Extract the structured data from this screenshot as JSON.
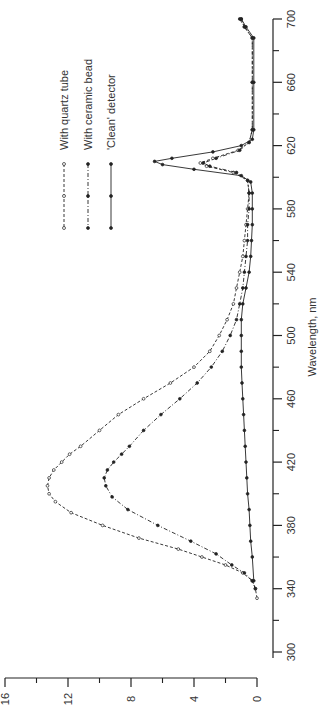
{
  "chart_data": {
    "type": "line",
    "orientation": "rotated-90-ccw",
    "title": "",
    "xlabel": "Wavelength, nm",
    "ylabel": "",
    "xlim": [
      300,
      700
    ],
    "ylim": [
      0,
      16
    ],
    "x_ticks": [
      300,
      340,
      380,
      420,
      460,
      500,
      540,
      580,
      620,
      660,
      700
    ],
    "x_tick_labels": [
      "300",
      "340",
      "380",
      "420",
      "460",
      "500",
      "540",
      "580",
      "620",
      "660",
      "700"
    ],
    "x_minor_ticks": [
      320,
      360,
      400,
      440,
      480,
      520,
      560,
      600,
      640,
      680
    ],
    "y_ticks": [
      0,
      4,
      8,
      12,
      16
    ],
    "y_tick_labels": [
      "0",
      "4",
      "8",
      "12",
      "16"
    ],
    "y_minor_ticks": [
      2,
      6,
      10,
      14
    ],
    "grid": false,
    "legend_position": "upper-left (rotated)",
    "series": [
      {
        "name": "With quartz tube",
        "style": "dashed",
        "marker": "open-circle",
        "points": [
          [
            334,
            0.0
          ],
          [
            340,
            0.1
          ],
          [
            345,
            0.3
          ],
          [
            350,
            0.9
          ],
          [
            355,
            2.0
          ],
          [
            360,
            3.5
          ],
          [
            365,
            5.0
          ],
          [
            372,
            7.5
          ],
          [
            380,
            9.8
          ],
          [
            388,
            11.8
          ],
          [
            395,
            12.8
          ],
          [
            400,
            13.2
          ],
          [
            405,
            13.3
          ],
          [
            410,
            13.2
          ],
          [
            415,
            12.9
          ],
          [
            420,
            12.4
          ],
          [
            425,
            11.9
          ],
          [
            430,
            11.2
          ],
          [
            440,
            10.0
          ],
          [
            450,
            8.8
          ],
          [
            460,
            7.2
          ],
          [
            470,
            5.5
          ],
          [
            480,
            4.0
          ],
          [
            490,
            3.0
          ],
          [
            500,
            2.4
          ],
          [
            510,
            1.9
          ],
          [
            520,
            1.5
          ],
          [
            530,
            1.3
          ],
          [
            540,
            1.1
          ],
          [
            550,
            0.9
          ],
          [
            560,
            0.8
          ],
          [
            570,
            0.7
          ],
          [
            580,
            0.6
          ],
          [
            590,
            0.5
          ],
          [
            598,
            0.6
          ],
          [
            603,
            1.5
          ],
          [
            607,
            3.2
          ],
          [
            609,
            3.6
          ],
          [
            612,
            2.8
          ],
          [
            617,
            1.2
          ],
          [
            622,
            0.5
          ],
          [
            630,
            0.3
          ],
          [
            660,
            0.3
          ],
          [
            688,
            0.3
          ],
          [
            695,
            0.8
          ],
          [
            700,
            1.0
          ]
        ]
      },
      {
        "name": "With ceramic bead",
        "style": "dash-dot",
        "marker": "filled-circle",
        "points": [
          [
            340,
            0.1
          ],
          [
            345,
            0.3
          ],
          [
            350,
            0.8
          ],
          [
            355,
            1.6
          ],
          [
            362,
            2.6
          ],
          [
            370,
            4.2
          ],
          [
            380,
            6.3
          ],
          [
            390,
            8.2
          ],
          [
            398,
            9.2
          ],
          [
            405,
            9.6
          ],
          [
            410,
            9.7
          ],
          [
            415,
            9.5
          ],
          [
            420,
            9.1
          ],
          [
            425,
            8.6
          ],
          [
            430,
            8.1
          ],
          [
            440,
            7.2
          ],
          [
            450,
            6.1
          ],
          [
            460,
            4.9
          ],
          [
            470,
            3.8
          ],
          [
            480,
            2.9
          ],
          [
            490,
            2.2
          ],
          [
            500,
            1.7
          ],
          [
            510,
            1.3
          ],
          [
            520,
            1.1
          ],
          [
            530,
            0.9
          ],
          [
            540,
            0.8
          ],
          [
            550,
            0.7
          ],
          [
            560,
            0.6
          ],
          [
            570,
            0.6
          ],
          [
            580,
            0.5
          ],
          [
            590,
            0.5
          ],
          [
            598,
            0.6
          ],
          [
            603,
            1.3
          ],
          [
            607,
            3.0
          ],
          [
            609,
            3.4
          ],
          [
            612,
            2.6
          ],
          [
            617,
            1.1
          ],
          [
            622,
            0.5
          ],
          [
            630,
            0.3
          ],
          [
            660,
            0.3
          ],
          [
            688,
            0.3
          ],
          [
            695,
            0.8
          ],
          [
            700,
            1.1
          ]
        ]
      },
      {
        "name": "'Clean' detector",
        "style": "solid",
        "marker": "filled-circle",
        "points": [
          [
            345,
            0.2
          ],
          [
            360,
            0.3
          ],
          [
            370,
            0.4
          ],
          [
            380,
            0.45
          ],
          [
            390,
            0.5
          ],
          [
            400,
            0.6
          ],
          [
            410,
            0.65
          ],
          [
            420,
            0.7
          ],
          [
            430,
            0.75
          ],
          [
            440,
            0.8
          ],
          [
            450,
            0.85
          ],
          [
            460,
            0.9
          ],
          [
            470,
            0.95
          ],
          [
            480,
            1.0
          ],
          [
            490,
            1.0
          ],
          [
            500,
            1.0
          ],
          [
            510,
            1.0
          ],
          [
            520,
            0.9
          ],
          [
            530,
            0.7
          ],
          [
            540,
            0.5
          ],
          [
            550,
            0.4
          ],
          [
            560,
            0.35
          ],
          [
            570,
            0.3
          ],
          [
            580,
            0.3
          ],
          [
            590,
            0.3
          ],
          [
            597,
            0.4
          ],
          [
            601,
            1.0
          ],
          [
            605,
            4.0
          ],
          [
            608,
            6.0
          ],
          [
            610,
            6.5
          ],
          [
            612,
            5.4
          ],
          [
            616,
            2.8
          ],
          [
            620,
            1.0
          ],
          [
            624,
            0.3
          ],
          [
            630,
            0.2
          ],
          [
            660,
            0.2
          ],
          [
            688,
            0.2
          ],
          [
            695,
            0.7
          ],
          [
            700,
            1.0
          ]
        ]
      }
    ]
  },
  "legend": {
    "items": [
      {
        "label": "With quartz tube",
        "style": "dashed",
        "marker": "open-circle"
      },
      {
        "label": "With ceramic bead",
        "style": "dash-dot",
        "marker": "filled-circle"
      },
      {
        "label": "'Clean' detector",
        "style": "solid",
        "marker": "filled-circle"
      }
    ]
  },
  "axes": {
    "wavelength_label": "Wavelength, nm",
    "wavelength_tick_labels": [
      "300",
      "340",
      "380",
      "420",
      "460",
      "500",
      "540",
      "580",
      "620",
      "660",
      "700"
    ],
    "intensity_tick_labels": [
      "0",
      "4",
      "8",
      "12",
      "16"
    ]
  },
  "colors": {
    "ink": "#222222",
    "background": "#ffffff"
  }
}
